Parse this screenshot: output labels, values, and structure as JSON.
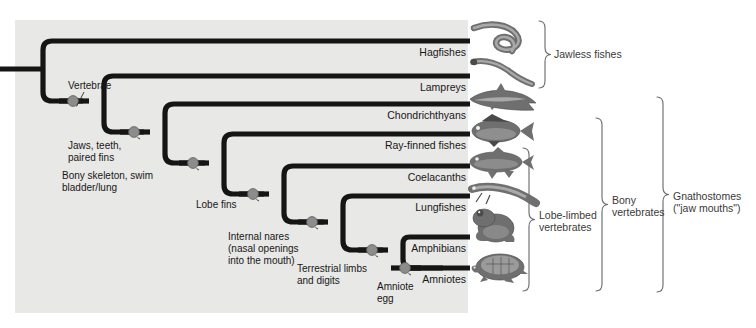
{
  "figure": {
    "type": "phylogenetic-tree",
    "panel_color": "#e8e8e6",
    "branch_color": "#151515",
    "node_color": "#8c8c8c",
    "bracket_color": "#6e6e6e",
    "text_color": "#171717"
  },
  "taxa": [
    {
      "id": "hagfishes",
      "label": "Hagfishes",
      "y": 41,
      "animal": "hagfish-illustration"
    },
    {
      "id": "lampreys",
      "label": "Lampreys",
      "y": 76,
      "animal": "lamprey-illustration"
    },
    {
      "id": "chondrichthyans",
      "label": "Chondrichthyans",
      "y": 104,
      "animal": "shark-illustration"
    },
    {
      "id": "rayfinned",
      "label": "Ray-finned fishes",
      "y": 134,
      "animal": "perch-illustration"
    },
    {
      "id": "coelacanths",
      "label": "Coelacanths",
      "y": 166,
      "animal": "coelacanth-illustration"
    },
    {
      "id": "lungfishes",
      "label": "Lungfishes",
      "y": 196,
      "animal": "lungfish-illustration"
    },
    {
      "id": "amphibians",
      "label": "Amphibians",
      "y": 237,
      "animal": "frog-illustration"
    },
    {
      "id": "amniotes",
      "label": "Amniotes",
      "y": 268,
      "animal": "turtle-illustration"
    }
  ],
  "nodes": [
    {
      "id": "vertebrae",
      "label": "Vertebrae",
      "x": 73,
      "y": 101
    },
    {
      "id": "jaws",
      "label": "Jaws, teeth,\npaired fins",
      "x": 134,
      "y": 132
    },
    {
      "id": "bony-skeleton",
      "label": "Bony skeleton, swim\nbladder/lung",
      "x": 193,
      "y": 163
    },
    {
      "id": "lobe-fins",
      "label": "Lobe fins",
      "x": 253,
      "y": 194
    },
    {
      "id": "internal-nares",
      "label": "Internal nares\n(nasal openings\ninto the mouth)",
      "x": 312,
      "y": 222
    },
    {
      "id": "terrestrial",
      "label": "Terrestrial limbs\nand digits",
      "x": 372,
      "y": 250
    },
    {
      "id": "amniote-egg",
      "label": "Amniote\negg",
      "x": 405,
      "y": 268
    }
  ],
  "brackets": [
    {
      "id": "jawless-fishes",
      "label": "Jawless fishes",
      "x": 545,
      "top": 21,
      "bottom": 88,
      "label_x": 554,
      "label_y": 48
    },
    {
      "id": "lobe-limbed",
      "label": "Lobe-limbed\nvertebrates",
      "x": 529,
      "top": 148,
      "bottom": 291,
      "label_x": 539,
      "label_y": 209
    },
    {
      "id": "bony-vertebrates",
      "label": "Bony\nvertebrates",
      "x": 602,
      "top": 118,
      "bottom": 291,
      "label_x": 612,
      "label_y": 194
    },
    {
      "id": "gnathostomes",
      "label": "Gnathostomes\n(\"jaw mouths\")",
      "x": 663,
      "top": 97,
      "bottom": 292,
      "label_x": 673,
      "label_y": 190
    }
  ],
  "panel": {
    "x": 15,
    "y": 20,
    "width": 453,
    "height": 293
  },
  "root": {
    "x": 0,
    "y": 69,
    "fork_x": 43
  }
}
